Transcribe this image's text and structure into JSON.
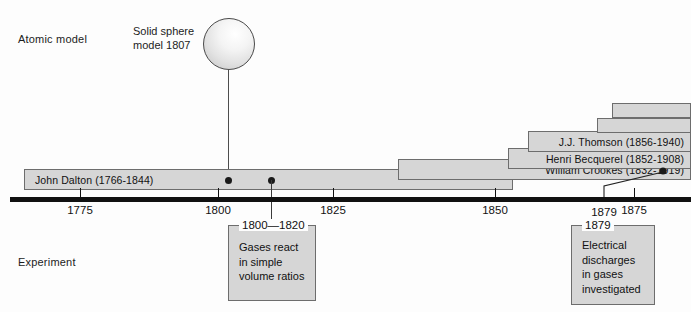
{
  "rows": {
    "atomic_model_label": "Atomic model",
    "experiment_label": "Experiment"
  },
  "sphere": {
    "caption_line1": "Solid sphere",
    "caption_line2": "model 1807",
    "name": "solid-sphere-model"
  },
  "axis": {
    "ticks": [
      {
        "label": "1775",
        "x": 80
      },
      {
        "label": "1800",
        "x": 218
      },
      {
        "label": "1825",
        "x": 333
      },
      {
        "label": "1850",
        "x": 495
      },
      {
        "label": "1875",
        "x": 634
      }
    ],
    "callout_tick": {
      "label": "1879",
      "x": 604
    }
  },
  "bars": [
    {
      "label": "John Dalton (1766-1844)",
      "align": "left",
      "x": 24,
      "y": 169,
      "width": 489,
      "name": "bar-john-dalton"
    },
    {
      "label": "William Crookes (1832-1919)",
      "align": "right",
      "x": 398,
      "y": 159,
      "width": 293,
      "name": "bar-william-crookes"
    },
    {
      "label": "Henri Becquerel (1852-1908)",
      "align": "right",
      "x": 508,
      "y": 148,
      "width": 183,
      "name": "bar-henri-becquerel"
    },
    {
      "label": "J.J. Thomson (1856-1940)",
      "align": "right",
      "x": 528,
      "y": 131,
      "width": 163,
      "name": "bar-jj-thomson"
    }
  ],
  "unlabeled_bars": [
    {
      "x": 597,
      "y": 118,
      "width": 94,
      "name": "bar-unlabeled-lower"
    },
    {
      "x": 612,
      "y": 103,
      "width": 79,
      "name": "bar-unlabeled-upper"
    }
  ],
  "notes": [
    {
      "title": "1800—1820",
      "body": "Gases react\nin simple\nvolume ratios",
      "name": "note-gases-react"
    },
    {
      "title": "1879",
      "body": "Electrical\ndischarges\nin gases\ninvestigated",
      "name": "note-electrical-discharges"
    }
  ],
  "colors": {
    "bar_fill": "#d6d6d6",
    "bar_border": "#6d6d6d",
    "axis": "#111111",
    "text": "#111111",
    "page_bg": "#fdfdfd"
  }
}
